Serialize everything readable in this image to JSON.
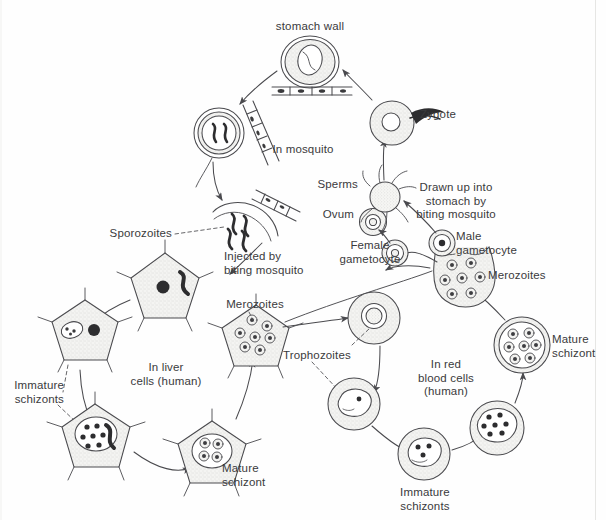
{
  "diagram": {
    "background": "#fefefe",
    "ink": "#4a4a4e",
    "fill": "#f3f3f1",
    "labels": {
      "stomach_wall": "stomach wall",
      "zygote": "Zygote",
      "in_mosquito": "In mosquito",
      "sperms": "Sperms",
      "drawn_up": "Drawn up into\nstomach by\nbiting mosquito",
      "ovum": "Ovum",
      "female_gametocyte": "Female\ngametocyte",
      "male_gametocyte": "Male\ngametocyte",
      "merozoites_blood": "Merozoites",
      "mature_schizont_blood": "Mature\nschizont",
      "in_red_blood_cells": "In red\nblood cells\n(human)",
      "immature_schizonts_blood": "Immature\nschizonts",
      "trophozoites": "Trophozoites",
      "merozoites_liver": "Merozoites",
      "in_liver_cells": "In liver\ncells (human)",
      "immature_schizonts_liver": "Immature\nschizonts",
      "mature_schizont_liver": "Mature\nschizont",
      "sporozoites": "Sporozoites",
      "injected_by": "Injected by\nbiting mosquito"
    },
    "stages": [
      {
        "id": "oocyst-stomach-wall",
        "name": "oocyst on stomach wall",
        "cx": 310,
        "cy": 62
      },
      {
        "id": "oocyst-sporozoites",
        "name": "oocyst with sporozoites",
        "cx": 219,
        "cy": 133
      },
      {
        "id": "oocyst-bursting",
        "name": "bursting oocyst releasing sporozoites",
        "cx": 243,
        "cy": 215
      },
      {
        "id": "liver-cell-infected",
        "name": "infected liver cell",
        "cx": 165,
        "cy": 285
      },
      {
        "id": "liver-cell-2nuclei",
        "name": "liver cell dividing",
        "cx": 85,
        "cy": 330
      },
      {
        "id": "liver-immature-schizont",
        "name": "liver immature schizont",
        "cx": 95,
        "cy": 435
      },
      {
        "id": "liver-mature-schizont",
        "name": "liver mature schizont",
        "cx": 212,
        "cy": 452
      },
      {
        "id": "liver-merozoites",
        "name": "liver cell with merozoites",
        "cx": 256,
        "cy": 337
      },
      {
        "id": "rbc-ring",
        "name": "red blood cell ring stage",
        "cx": 374,
        "cy": 318
      },
      {
        "id": "rbc-trophozoite",
        "name": "red blood cell trophozoite",
        "cx": 354,
        "cy": 404
      },
      {
        "id": "rbc-immature-schizont",
        "name": "red blood cell immature schizont",
        "cx": 424,
        "cy": 454
      },
      {
        "id": "rbc-mature-schizont2",
        "name": "red blood cell schizont",
        "cx": 497,
        "cy": 428
      },
      {
        "id": "rbc-mature-schizont",
        "name": "red blood cell mature schizont",
        "cx": 522,
        "cy": 345
      },
      {
        "id": "rbc-merozoites",
        "name": "bursting red blood cell with merozoites",
        "cx": 462,
        "cy": 283
      },
      {
        "id": "male-gametocyte",
        "name": "male gametocyte",
        "cx": 442,
        "cy": 243
      },
      {
        "id": "female-gametocyte",
        "name": "female gametocyte",
        "cx": 395,
        "cy": 253
      },
      {
        "id": "ovum",
        "name": "ovum",
        "cx": 373,
        "cy": 222
      },
      {
        "id": "sperms",
        "name": "sperms / microgametes",
        "cx": 385,
        "cy": 196
      },
      {
        "id": "zygote",
        "name": "zygote ookinete",
        "cx": 392,
        "cy": 123
      }
    ]
  }
}
